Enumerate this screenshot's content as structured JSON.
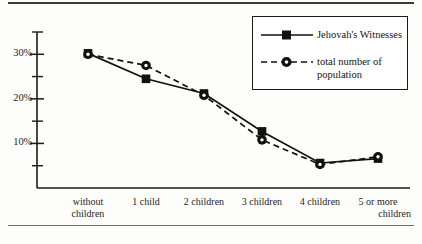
{
  "chart_data": {
    "type": "line",
    "title": "",
    "subtitle": "",
    "xlabel": "",
    "ylabel": "",
    "categories": [
      "without children",
      "1 child",
      "2 children",
      "3 children",
      "4 children",
      "5 or more children"
    ],
    "category_lines": [
      [
        "without",
        "children"
      ],
      [
        "1 child",
        ""
      ],
      [
        "2 children",
        ""
      ],
      [
        "3 children",
        ""
      ],
      [
        "4 children",
        ""
      ],
      [
        "5 or more",
        "children"
      ]
    ],
    "series": [
      {
        "name": "Jehovah's Witnesses",
        "marker": "square",
        "line_style": "solid",
        "color": "#111111",
        "values": [
          30.2,
          24.5,
          21.2,
          12.7,
          5.6,
          6.6
        ]
      },
      {
        "name": "total number of population",
        "marker": "circle",
        "line_style": "dashed",
        "color": "#111111",
        "values": [
          30.0,
          27.5,
          20.8,
          10.8,
          5.3,
          7.0
        ]
      }
    ],
    "ylim": [
      0,
      35
    ],
    "ytick_major": [
      10,
      20,
      30
    ],
    "ytick_major_labels": [
      "10%",
      "20%",
      "30%"
    ],
    "ytick_minor": [
      5,
      15,
      25,
      35
    ],
    "grid": false,
    "legend_position": "top-right",
    "legend_entries": [
      "Jehovah's Witnesses",
      "total number of\npopulation"
    ]
  },
  "axis": {
    "y_labels": [
      "30%",
      "20%",
      "10%"
    ]
  }
}
